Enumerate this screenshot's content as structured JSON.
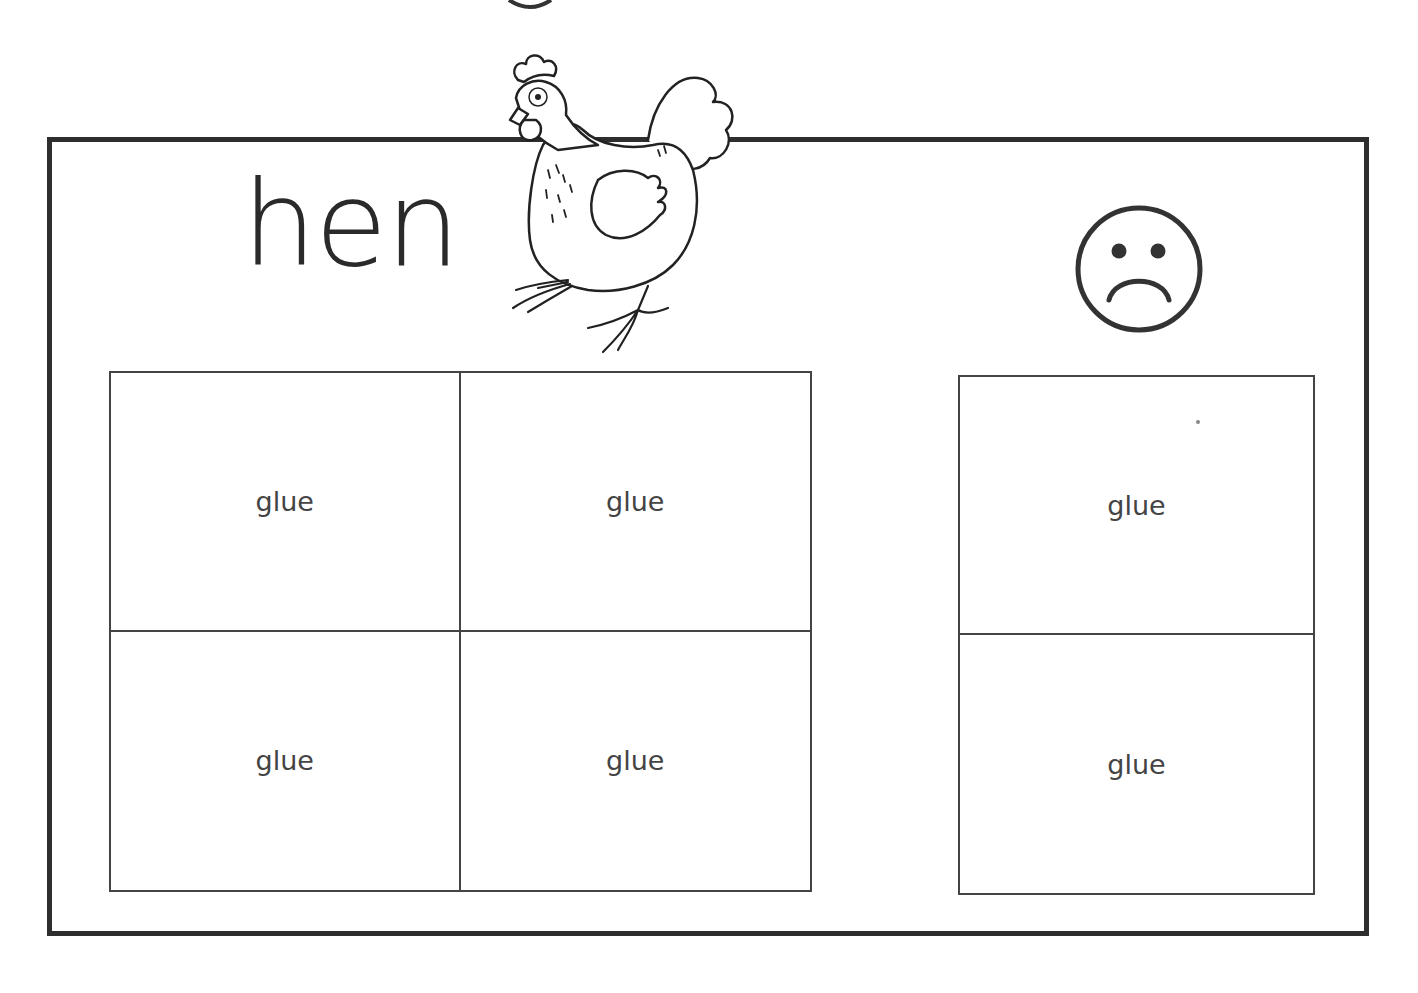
{
  "worksheet": {
    "title_word": "hen",
    "header_picture": "hen-illustration",
    "negative_symbol": "sad-face",
    "sort_grid_yes": {
      "cells": [
        "glue",
        "glue",
        "glue",
        "glue"
      ]
    },
    "sort_grid_no": {
      "cells": [
        "glue",
        "glue"
      ]
    },
    "colors": {
      "frame": "#2e2e2e",
      "grid_lines": "#444444",
      "text": "#2a2a2a",
      "background": "#ffffff"
    }
  }
}
